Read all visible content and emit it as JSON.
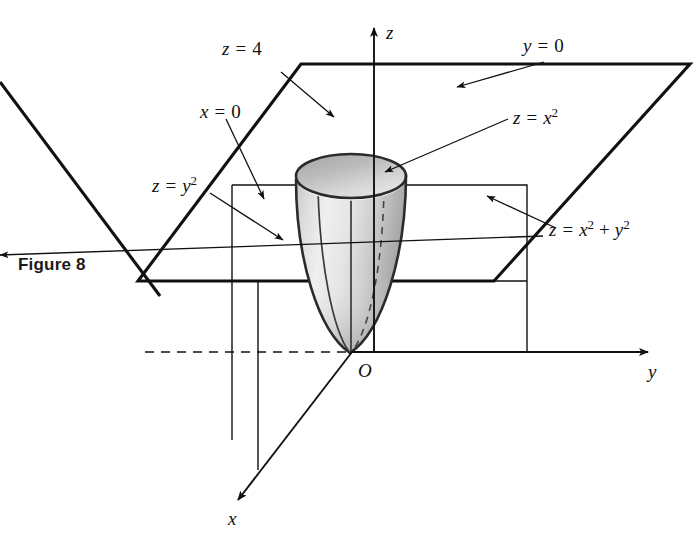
{
  "figure": {
    "caption": "Figure 8"
  },
  "axes": {
    "z_label": "z",
    "y_label": "y",
    "x_label": "x",
    "origin_label": "O"
  },
  "labels": {
    "plane_z4": {
      "lhs": "z",
      "op": "=",
      "rhs": "4",
      "full": "z = 4"
    },
    "plane_y0": {
      "lhs": "y",
      "op": "=",
      "rhs": "0",
      "full": "y = 0"
    },
    "plane_x0": {
      "lhs": "x",
      "op": "=",
      "rhs": "0",
      "full": "x = 0"
    },
    "trace_zx2": {
      "lhs": "z",
      "op": "=",
      "var": "x",
      "exp": "2",
      "full": "z = x2"
    },
    "trace_zy2": {
      "lhs": "z",
      "op": "=",
      "var": "y",
      "exp": "2",
      "full": "z = y2"
    },
    "surface_paraboloid": {
      "lhs": "z",
      "op": "=",
      "var1": "x",
      "exp1": "2",
      "plus": "+",
      "var2": "y",
      "exp2": "2",
      "full": "z = x2 + y2"
    }
  },
  "colors": {
    "ink": "#111111",
    "surface_light": "#ededed",
    "surface_mid": "#d2d2d2",
    "surface_dark": "#a9a9a9",
    "rim_interior": "#b9b9b9",
    "background": "#ffffff"
  },
  "icons": {
    "arrow_z": "arrow-up-icon",
    "arrow_y": "arrow-right-icon",
    "arrow_x": "arrow-down-left-icon",
    "leader_arrow": "leader-arrow-icon"
  }
}
